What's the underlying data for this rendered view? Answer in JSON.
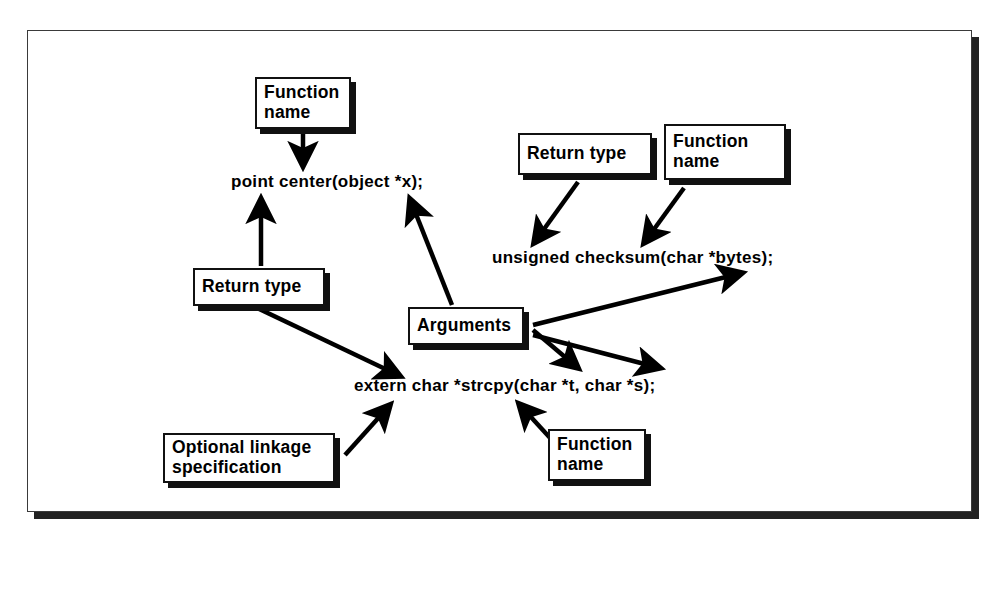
{
  "figure": {
    "background_color": "#ffffff",
    "frame_color": "#3a3a3a",
    "shadow_color": "#222222",
    "ink_color": "#000000"
  },
  "code_lines": [
    {
      "id": "decl-point-center",
      "text": "point  center(object *x);"
    },
    {
      "id": "decl-unsigned-checksum",
      "text": "unsigned  checksum(char *bytes);"
    },
    {
      "id": "decl-extern-strcpy",
      "text": "extern  char  *strcpy(char *t,  char *s);"
    }
  ],
  "labels": [
    {
      "id": "label-function-name-top",
      "text": "Function\nname"
    },
    {
      "id": "label-return-type-left",
      "text": "Return type"
    },
    {
      "id": "label-return-type-right",
      "text": "Return type"
    },
    {
      "id": "label-function-name-right",
      "text": "Function\nname"
    },
    {
      "id": "label-arguments",
      "text": "Arguments"
    },
    {
      "id": "label-optional-linkage",
      "text": "Optional linkage\nspecification"
    },
    {
      "id": "label-function-name-bottom",
      "text": "Function\nname"
    }
  ],
  "connectors": [
    {
      "id": "arrow-function-name-top-to-center",
      "from": "label-function-name-top",
      "to": "decl-point-center"
    },
    {
      "id": "arrow-return-type-left-to-point",
      "from": "label-return-type-left",
      "to": "decl-point-center"
    },
    {
      "id": "arrow-return-type-left-to-extern",
      "from": "label-return-type-left",
      "to": "decl-extern-strcpy"
    },
    {
      "id": "arrow-arguments-to-object-x",
      "from": "label-arguments",
      "to": "decl-point-center"
    },
    {
      "id": "arrow-return-type-right-to-unsigned",
      "from": "label-return-type-right",
      "to": "decl-unsigned-checksum"
    },
    {
      "id": "arrow-function-name-right-to-checksum",
      "from": "label-function-name-right",
      "to": "decl-unsigned-checksum"
    },
    {
      "id": "arrow-arguments-to-bytes",
      "from": "label-arguments",
      "to": "decl-unsigned-checksum"
    },
    {
      "id": "arrow-arguments-to-char-t",
      "from": "label-arguments",
      "to": "decl-extern-strcpy"
    },
    {
      "id": "arrow-arguments-to-char-s",
      "from": "label-arguments",
      "to": "decl-extern-strcpy"
    },
    {
      "id": "arrow-optional-linkage-to-extern",
      "from": "label-optional-linkage",
      "to": "decl-extern-strcpy"
    },
    {
      "id": "arrow-function-name-bottom-to-strcpy",
      "from": "label-function-name-bottom",
      "to": "decl-extern-strcpy"
    }
  ]
}
